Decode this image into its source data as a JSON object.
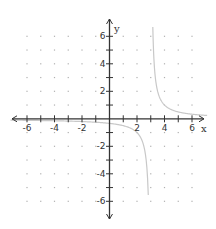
{
  "chart_data": {
    "type": "line",
    "title": "",
    "xlabel": "x",
    "ylabel": "y",
    "xlim": [
      -7,
      7
    ],
    "ylim": [
      -7,
      7
    ],
    "grid": "dots at integer lattice points",
    "x_ticks": [
      -6,
      -5,
      -4,
      -3,
      -2,
      -1,
      1,
      2,
      3,
      4,
      5,
      6
    ],
    "y_ticks": [
      -6,
      -5,
      -4,
      -3,
      -2,
      -1,
      1,
      2,
      3,
      4,
      5,
      6
    ],
    "x_tick_labels": [
      "-6",
      "-4",
      "-2",
      "2",
      "4",
      "6"
    ],
    "y_tick_labels": [
      "6",
      "4",
      "2",
      "-2",
      "-4",
      "-6"
    ],
    "series": [
      {
        "name": "y = 1/(x - 3)",
        "vertical_asymptote": 3,
        "horizontal_asymptote": 0,
        "x": [
          -7,
          -6,
          -4,
          -2,
          0,
          1,
          2,
          2.5,
          2.8,
          2.85,
          3.15,
          3.2,
          3.5,
          4,
          5,
          6,
          7
        ],
        "y": [
          -0.1,
          -0.111,
          -0.143,
          -0.2,
          -0.333,
          -0.5,
          -1,
          -2,
          -5,
          -6.67,
          6.67,
          5,
          2,
          1,
          0.5,
          0.333,
          0.25
        ]
      }
    ],
    "colors": {
      "axis": "#333333",
      "curve": "#c8c8c8",
      "grid_dots": "#b0b0b0"
    }
  }
}
